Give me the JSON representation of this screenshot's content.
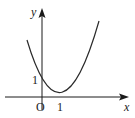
{
  "diagram": {
    "type": "function-graph",
    "axes": {
      "x_label": "x",
      "y_label": "y",
      "origin_label": "O",
      "x_tick_label": "1",
      "y_tick_label": "1"
    },
    "curve": {
      "kind": "parabola",
      "vertex": [
        1,
        0
      ],
      "y_intercept": 1,
      "color": "#2a2a2a"
    },
    "colors": {
      "axis": "#1a1a1a",
      "background": "#ffffff"
    }
  }
}
